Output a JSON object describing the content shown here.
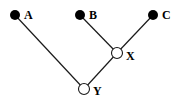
{
  "diagram": {
    "type": "tree",
    "nodes": [
      {
        "id": "A",
        "label": "A",
        "kind": "leaf",
        "fill": "#000000"
      },
      {
        "id": "B",
        "label": "B",
        "kind": "leaf",
        "fill": "#000000"
      },
      {
        "id": "C",
        "label": "C",
        "kind": "leaf",
        "fill": "#000000"
      },
      {
        "id": "X",
        "label": "X",
        "kind": "internal",
        "fill": "#ffffff"
      },
      {
        "id": "Y",
        "label": "Y",
        "kind": "internal",
        "fill": "#ffffff"
      }
    ],
    "edges": [
      {
        "from": "A",
        "to": "Y"
      },
      {
        "from": "B",
        "to": "X"
      },
      {
        "from": "C",
        "to": "X"
      },
      {
        "from": "X",
        "to": "Y"
      }
    ],
    "root": "Y"
  }
}
